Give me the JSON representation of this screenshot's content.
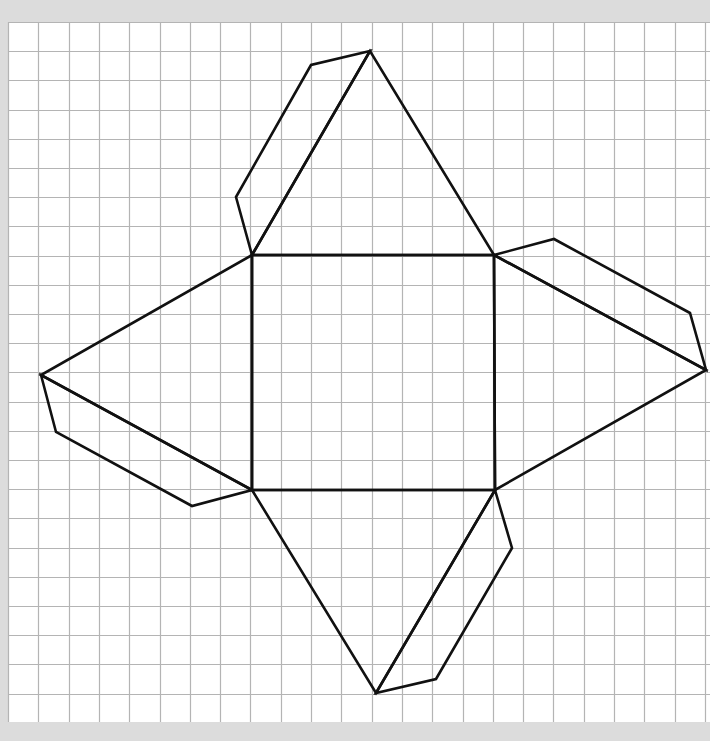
{
  "diagram": {
    "title": "Net of a square pyramid with glue flaps on grid paper",
    "canvas": {
      "width": 710,
      "height": 741
    },
    "colors": {
      "background": "#dcdcdc",
      "paper": "#ffffff",
      "grid_line": "#b4b4b4",
      "stroke": "#111111"
    },
    "grid": {
      "x0": 8,
      "y0": 22,
      "cell_w": 30.3,
      "cell_h": 29.2,
      "right": 710,
      "bottom": 722
    },
    "stroke_width": 2.6,
    "shapes": [
      {
        "name": "base-square",
        "points": [
          [
            252,
            255
          ],
          [
            494,
            255
          ],
          [
            495,
            490
          ],
          [
            252,
            490
          ]
        ]
      },
      {
        "name": "top-triangle",
        "points": [
          [
            252,
            255
          ],
          [
            370,
            51
          ],
          [
            494,
            255
          ]
        ]
      },
      {
        "name": "right-triangle",
        "points": [
          [
            494,
            255
          ],
          [
            706,
            370
          ],
          [
            495,
            490
          ]
        ]
      },
      {
        "name": "bottom-triangle",
        "points": [
          [
            252,
            490
          ],
          [
            376,
            693
          ],
          [
            495,
            490
          ]
        ]
      },
      {
        "name": "left-triangle",
        "points": [
          [
            252,
            255
          ],
          [
            41,
            375
          ],
          [
            252,
            490
          ]
        ]
      },
      {
        "name": "top-flap",
        "points": [
          [
            370,
            51
          ],
          [
            311,
            65
          ],
          [
            236,
            197
          ],
          [
            252,
            255
          ]
        ]
      },
      {
        "name": "right-flap",
        "points": [
          [
            494,
            255
          ],
          [
            554,
            239
          ],
          [
            690,
            313
          ],
          [
            706,
            370
          ]
        ]
      },
      {
        "name": "bottom-flap",
        "points": [
          [
            495,
            490
          ],
          [
            512,
            548
          ],
          [
            436,
            679
          ],
          [
            376,
            693
          ]
        ]
      },
      {
        "name": "left-flap",
        "points": [
          [
            41,
            375
          ],
          [
            56,
            432
          ],
          [
            192,
            506
          ],
          [
            252,
            490
          ]
        ]
      }
    ]
  }
}
